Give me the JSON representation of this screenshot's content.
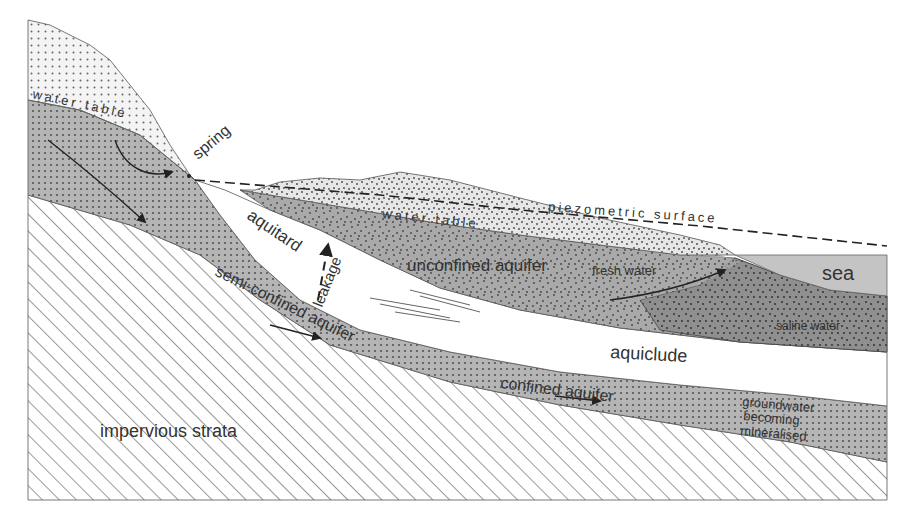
{
  "diagram": {
    "type": "hydrogeological cross-section",
    "labels": {
      "water_table_left": "water table",
      "spring": "spring",
      "water_table_mid": "water table",
      "piezometric_surface": "piezometric surface",
      "aquitard": "aquitard",
      "leakage": "leakage",
      "unconfined_aquifer": "unconfined aquifer",
      "fresh_water": "fresh water",
      "sea": "sea",
      "saline_water": "saline water",
      "semi_confined_aquifer": "semi-confined aquifer",
      "aquiclude": "aquiclude",
      "confined_aquifer": "confined aquifer",
      "groundwater_1": "groundwater",
      "groundwater_2": "becoming",
      "groundwater_3": "mineralised",
      "impervious_strata": "impervious strata"
    },
    "colors": {
      "aquifer_gray": "#b8b8b8",
      "sea_gray": "#c4c4c4",
      "saline_gray": "#9a9a9a",
      "light_sand": "#eeeeee",
      "line": "#333333"
    }
  }
}
